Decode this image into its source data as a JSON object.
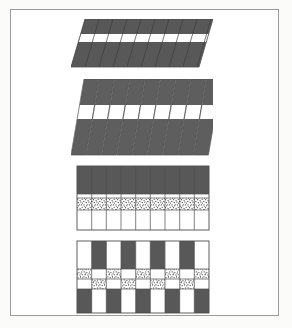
{
  "figure": {
    "title": "",
    "background_color": "#fbfbfa",
    "page_color": "#ffffff",
    "frame_border_color": "#9b9b9b",
    "frame": {
      "x": 10,
      "y": 9,
      "width": 269,
      "height": 307
    },
    "palette": {
      "dark_fill": "#585858",
      "dark_fill_alt": "#5e5e5e",
      "white_fill": "#ffffff",
      "speckle_background": "#ffffff",
      "speckle_dot": "#4a4a4a",
      "outline": "#4d4d4d",
      "thin_rule": "#6d6d6d"
    },
    "panel_count": 4,
    "panels": [
      {
        "id": "panel-1",
        "name": "horizontal-banded-sheared-block",
        "label": "",
        "x": 70,
        "y": 18,
        "width": 138,
        "height": 48,
        "description": "Horizontal three-band block: dark band, white band, dark band, overlaid with parallel diagonal shear lines.",
        "shear_lines": 9,
        "shear_dx": 14,
        "bands": [
          {
            "fill": "dark",
            "height_fraction": 0.3
          },
          {
            "fill": "white",
            "height_fraction": 0.17
          },
          {
            "fill": "dark",
            "height_fraction": 0.53
          }
        ]
      },
      {
        "id": "panel-2",
        "name": "sheared-column-array",
        "label": "",
        "x": 70,
        "y": 78,
        "width": 138,
        "height": 76,
        "description": "Nine slanted (sheared) vertical columns, each containing dark/white/dark bands offset stepwise so the white bands form a zigzag.",
        "columns": 9,
        "column_width": 15.3,
        "shear_dx": 13,
        "bands": [
          {
            "fill": "dark",
            "height_fraction": 0.34
          },
          {
            "fill": "white",
            "height_fraction": 0.18
          },
          {
            "fill": "dark",
            "height_fraction": 0.48
          }
        ]
      },
      {
        "id": "panel-3",
        "name": "three-layer-column-grid",
        "label": "",
        "x": 74,
        "y": 163,
        "width": 132,
        "height": 64,
        "description": "Rectangular grid of nine vertical columns with three stacked horizontal layers: dark top layer, speckled middle layer, white bottom layer.",
        "columns": 9,
        "layers": [
          {
            "fill": "dark",
            "height_fraction": 0.44
          },
          {
            "fill": "speckle",
            "height_fraction": 0.18
          },
          {
            "fill": "white",
            "height_fraction": 0.38
          }
        ]
      },
      {
        "id": "panel-4",
        "name": "offset-checkerboard-grid",
        "label": "",
        "x": 74,
        "y": 238,
        "width": 132,
        "height": 72,
        "description": "Nine-column checkerboard: alternating white and dark cells at top and bottom with staggered speckled bands in the two middle rows.",
        "columns": 9,
        "rows": 4,
        "top_row_pattern": [
          "white",
          "dark",
          "white",
          "dark",
          "white",
          "dark",
          "white",
          "dark",
          "white"
        ],
        "bottom_row_pattern": [
          "dark",
          "white",
          "dark",
          "white",
          "dark",
          "white",
          "dark",
          "white",
          "dark"
        ],
        "speckle_row_1_pattern": [
          "speckle",
          "white",
          "speckle",
          "white",
          "speckle",
          "white",
          "speckle",
          "white",
          "speckle"
        ],
        "speckle_row_2_pattern": [
          "white",
          "speckle",
          "white",
          "speckle",
          "white",
          "speckle",
          "white",
          "speckle",
          "white"
        ],
        "row_height_fractions": [
          0.38,
          0.14,
          0.14,
          0.34
        ]
      }
    ]
  }
}
